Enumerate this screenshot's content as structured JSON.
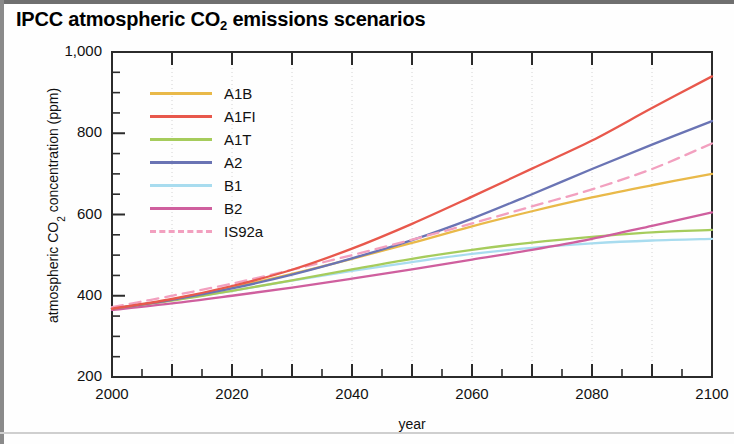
{
  "figure": {
    "title_main": "IPCC atmospheric CO",
    "title_sub": "2",
    "title_tail": " emissions scenarios",
    "title_full": "IPCC atmospheric CO2 emissions scenarios"
  },
  "axes": {
    "ylabel_main": "atmospheric CO",
    "ylabel_sub": "2",
    "ylabel_tail": " concentration (ppm)",
    "ylabel_full": "atmospheric CO2 concentration (ppm)",
    "xlabel": "year",
    "y_ticks": [
      "200",
      "400",
      "600",
      "800",
      "1,000"
    ],
    "x_ticks": [
      "2000",
      "2020",
      "2040",
      "2060",
      "2080",
      "2100"
    ]
  },
  "legend": {
    "items": [
      {
        "label": "A1B",
        "color": "#e9b949",
        "style": "solid"
      },
      {
        "label": "A1FI",
        "color": "#e8584c",
        "style": "solid"
      },
      {
        "label": "A1T",
        "color": "#a6cc5c",
        "style": "solid"
      },
      {
        "label": "A2",
        "color": "#6a74b4",
        "style": "solid"
      },
      {
        "label": "B1",
        "color": "#a8dcef",
        "style": "solid"
      },
      {
        "label": "B2",
        "color": "#cf5f9e",
        "style": "solid"
      },
      {
        "label": "IS92a",
        "color": "#f2a0bf",
        "style": "dashed"
      }
    ]
  },
  "chart_data": {
    "type": "line",
    "title": "IPCC atmospheric CO2 emissions scenarios",
    "xlabel": "year",
    "ylabel": "atmospheric CO2 concentration (ppm)",
    "xlim": [
      2000,
      2100
    ],
    "ylim": [
      200,
      1000
    ],
    "y_ticks": [
      200,
      400,
      600,
      800,
      1000
    ],
    "y_minor_tick_step": 50,
    "x_ticks": [
      2000,
      2020,
      2040,
      2060,
      2080,
      2100
    ],
    "x_minor_tick_step": 5,
    "grid": "vertical dotted gridlines every 10 years",
    "legend_position": "upper left, inside axes",
    "x": [
      2000,
      2010,
      2020,
      2030,
      2040,
      2050,
      2060,
      2070,
      2080,
      2090,
      2100
    ],
    "series": [
      {
        "name": "A1B",
        "color": "#e9b949",
        "style": "solid",
        "values": [
          368,
          390,
          420,
          454,
          491,
          530,
          571,
          608,
          642,
          672,
          700
        ]
      },
      {
        "name": "A1FI",
        "color": "#e8584c",
        "style": "solid",
        "values": [
          368,
          392,
          424,
          464,
          516,
          577,
          644,
          713,
          782,
          862,
          940
        ]
      },
      {
        "name": "A1T",
        "color": "#a6cc5c",
        "style": "solid",
        "values": [
          368,
          388,
          412,
          438,
          465,
          491,
          513,
          531,
          545,
          556,
          562
        ]
      },
      {
        "name": "A2",
        "color": "#6a74b4",
        "style": "solid",
        "values": [
          368,
          390,
          418,
          452,
          492,
          537,
          590,
          650,
          712,
          772,
          830
        ]
      },
      {
        "name": "B1",
        "color": "#a8dcef",
        "style": "solid",
        "values": [
          368,
          389,
          412,
          437,
          461,
          483,
          503,
          518,
          529,
          536,
          540
        ]
      },
      {
        "name": "B2",
        "color": "#cf5f9e",
        "style": "solid",
        "values": [
          365,
          381,
          400,
          420,
          442,
          465,
          489,
          513,
          540,
          572,
          605
        ]
      },
      {
        "name": "IS92a",
        "color": "#f2a0bf",
        "style": "dashed",
        "values": [
          372,
          400,
          430,
          464,
          500,
          538,
          578,
          620,
          662,
          712,
          775
        ]
      }
    ]
  }
}
